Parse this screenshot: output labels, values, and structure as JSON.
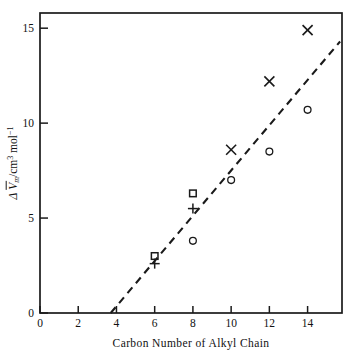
{
  "chart_data": {
    "type": "scatter",
    "title": "",
    "xlabel": "Carbon Number of Alkyl Chain",
    "ylabel": "Δ V̄m/cm³ mol⁻¹",
    "ylabel_parts": {
      "delta": "Δ",
      "v_bar": "V",
      "subscript": "m",
      "unit": "/cm",
      "unit_sup": "3",
      "unit2": " mol",
      "unit2_sup": "−1"
    },
    "xlim": [
      0,
      15.8
    ],
    "ylim": [
      0,
      15.8
    ],
    "xticks": [
      0,
      2,
      4,
      6,
      8,
      10,
      12,
      14
    ],
    "xticklabels": [
      "0",
      "2",
      "4",
      "6",
      "8",
      "10",
      "12",
      "14"
    ],
    "yticks": [
      0,
      5,
      10,
      15
    ],
    "yticklabels": [
      "0",
      "5",
      "10",
      "15"
    ],
    "grid": false,
    "legend": "none",
    "series": [
      {
        "name": "squares",
        "marker": "square",
        "points": [
          {
            "x": 6,
            "y": 3.0
          },
          {
            "x": 8,
            "y": 6.3
          }
        ]
      },
      {
        "name": "plus",
        "marker": "plus",
        "points": [
          {
            "x": 6,
            "y": 2.6
          },
          {
            "x": 8,
            "y": 5.5
          }
        ]
      },
      {
        "name": "circles",
        "marker": "circle",
        "points": [
          {
            "x": 8,
            "y": 3.8
          },
          {
            "x": 10,
            "y": 7.0
          },
          {
            "x": 12,
            "y": 8.5
          },
          {
            "x": 14,
            "y": 10.7
          }
        ]
      },
      {
        "name": "crosses",
        "marker": "cross",
        "points": [
          {
            "x": 10,
            "y": 8.6
          },
          {
            "x": 12,
            "y": 12.2
          },
          {
            "x": 14,
            "y": 14.9
          }
        ]
      }
    ],
    "trendline": {
      "style": "dashed",
      "x0": 3.7,
      "y0": 0,
      "x1": 15.7,
      "y1": 14.3
    }
  }
}
